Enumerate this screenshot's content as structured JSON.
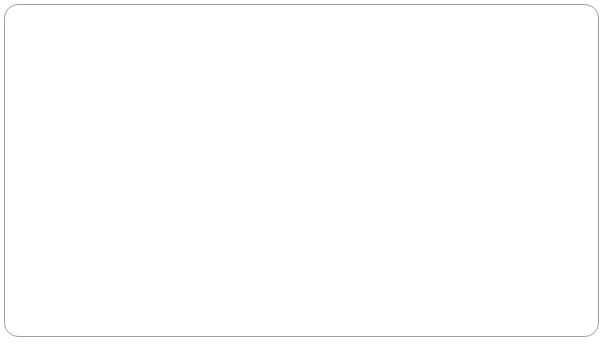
{
  "chart_data": {
    "type": "line",
    "title": "",
    "xlabel": "Atomic number",
    "ylabel": "Ionization energy (kJ/mol)",
    "xlim": [
      0,
      90
    ],
    "ylim": [
      0,
      2500
    ],
    "xticks": [
      0,
      10,
      20,
      30,
      40,
      50,
      60,
      70,
      80,
      90
    ],
    "xtick_labels": [
      "0",
      "10",
      "20",
      "30",
      "40",
      "50",
      "60",
      "70",
      "80",
      "90"
    ],
    "yticks": [
      0,
      500,
      1000,
      1500,
      2000,
      2500
    ],
    "ytick_labels": [
      "0",
      "500",
      "1000",
      "1500",
      "2000",
      "2500"
    ],
    "grid": false,
    "legend": "none",
    "line_color": "#8d8d8d",
    "text_color": "#1b1b1b",
    "x": [
      1,
      2,
      3,
      4,
      5,
      6,
      7,
      8,
      9,
      10,
      11,
      12,
      13,
      14,
      15,
      16,
      17,
      18,
      19,
      20,
      21,
      22,
      23,
      24,
      25,
      26,
      27,
      28,
      29,
      30,
      31,
      32,
      33,
      34,
      35,
      36,
      37,
      38,
      39,
      40,
      41,
      42,
      43,
      44,
      45,
      46,
      47,
      48,
      49,
      50,
      51,
      52,
      53,
      54,
      55,
      56,
      57,
      58,
      59,
      60,
      61,
      62,
      63,
      64,
      65,
      66,
      67,
      68,
      69,
      70,
      71,
      72,
      73,
      74,
      75,
      76,
      77,
      78,
      79,
      80,
      81,
      82,
      83,
      84,
      85,
      86
    ],
    "values": [
      1312,
      2372,
      520,
      900,
      801,
      1086,
      1402,
      1314,
      1681,
      2081,
      496,
      738,
      578,
      787,
      1012,
      1000,
      1251,
      1521,
      419,
      590,
      633,
      659,
      651,
      653,
      717,
      762,
      760,
      737,
      745,
      906,
      579,
      762,
      947,
      941,
      1140,
      1351,
      403,
      549,
      600,
      640,
      652,
      684,
      702,
      710,
      720,
      804,
      731,
      868,
      558,
      709,
      834,
      869,
      1008,
      1170,
      376,
      503,
      538,
      534,
      527,
      533,
      540,
      545,
      547,
      593,
      566,
      573,
      581,
      589,
      597,
      603,
      524,
      659,
      761,
      770,
      760,
      840,
      880,
      870,
      890,
      1007,
      589,
      716,
      703,
      812,
      920,
      1037
    ],
    "annotations": [
      {
        "label": "H",
        "x": 1,
        "y": 1312,
        "dx": -1,
        "dy": 48,
        "leader": true
      },
      {
        "label": "He",
        "x": 2,
        "y": 2372,
        "dx": 3,
        "dy": -12,
        "leader": false
      },
      {
        "label": "Li",
        "x": 3,
        "y": 520,
        "dx": 0,
        "dy": 20,
        "leader": false
      },
      {
        "label": "Be",
        "x": 4,
        "y": 900,
        "dx": 32,
        "dy": -7,
        "leader": true
      },
      {
        "label": "N",
        "x": 7,
        "y": 1402,
        "dx": -2,
        "dy": -11,
        "leader": false
      },
      {
        "label": "Ne",
        "x": 10,
        "y": 2081,
        "dx": 1,
        "dy": -12,
        "leader": false
      },
      {
        "label": "Na",
        "x": 11,
        "y": 496,
        "dx": 0,
        "dy": 21,
        "leader": false
      },
      {
        "label": "Mg",
        "x": 12,
        "y": 738,
        "dx": -26,
        "dy": -5,
        "leader": true
      },
      {
        "label": "P",
        "x": 15,
        "y": 1012,
        "dx": 0,
        "dy": -11,
        "leader": false
      },
      {
        "label": "Ar",
        "x": 18,
        "y": 1521,
        "dx": 0,
        "dy": -12,
        "leader": false
      },
      {
        "label": "K",
        "x": 19,
        "y": 419,
        "dx": 0,
        "dy": 21,
        "leader": false
      },
      {
        "label": "Zn",
        "x": 30,
        "y": 906,
        "dx": -2,
        "dy": -11,
        "leader": false
      },
      {
        "label": "As",
        "x": 33,
        "y": 947,
        "dx": -3,
        "dy": -29,
        "leader": true
      },
      {
        "label": "Kr",
        "x": 36,
        "y": 1351,
        "dx": 0,
        "dy": -12,
        "leader": false
      },
      {
        "label": "Rb",
        "x": 37,
        "y": 403,
        "dx": 1,
        "dy": 21,
        "leader": false
      },
      {
        "label": "Cd",
        "x": 48,
        "y": 868,
        "dx": -3,
        "dy": -12,
        "leader": false
      },
      {
        "label": "Xe",
        "x": 54,
        "y": 1170,
        "dx": 0,
        "dy": -12,
        "leader": false
      },
      {
        "label": "Cs",
        "x": 55,
        "y": 376,
        "dx": 1,
        "dy": 21,
        "leader": false
      },
      {
        "label": "Hg",
        "x": 80,
        "y": 1007,
        "dx": -2,
        "dy": -12,
        "leader": false
      },
      {
        "label": "Rn",
        "x": 86,
        "y": 1037,
        "dx": 1,
        "dy": -12,
        "leader": false
      }
    ]
  },
  "figure": {
    "border_color": "#9aa0a6",
    "background": "#ffffff"
  }
}
